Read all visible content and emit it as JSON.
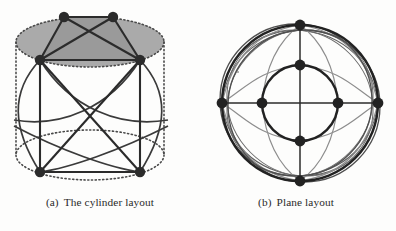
{
  "figure": {
    "background_color": "#fdfdfc",
    "ink_color": "#2b2b2b",
    "shade_color": "#a8a8a8",
    "faint_color": "#8d8d8d",
    "panels": [
      {
        "id": "cylinder",
        "caption_label": "(a)",
        "caption_text": "The cylinder layout",
        "node_radius": 5.2,
        "nodes": [
          {
            "name": "top-back-left",
            "x": 64,
            "y": 17
          },
          {
            "name": "top-back-right",
            "x": 113,
            "y": 17
          },
          {
            "name": "top-front-left",
            "x": 40,
            "y": 60
          },
          {
            "name": "top-front-right",
            "x": 140,
            "y": 60
          },
          {
            "name": "bottom-front-left",
            "x": 40,
            "y": 172
          },
          {
            "name": "bottom-front-right",
            "x": 140,
            "y": 172
          }
        ],
        "top_ellipse": {
          "cx": 90,
          "cy": 42,
          "rx": 74,
          "ry": 25
        },
        "bottom_ellipse": {
          "cx": 90,
          "cy": 155,
          "rx": 74,
          "ry": 25
        },
        "cylinder_height": 113,
        "straight_edges": [
          [
            "top-back-left",
            "top-back-right"
          ],
          [
            "top-back-left",
            "top-front-left"
          ],
          [
            "top-back-left",
            "top-front-right"
          ],
          [
            "top-back-right",
            "top-front-left"
          ],
          [
            "top-back-right",
            "top-front-right"
          ],
          [
            "top-front-left",
            "top-front-right"
          ],
          [
            "top-front-left",
            "bottom-front-left"
          ],
          [
            "top-front-right",
            "bottom-front-right"
          ],
          [
            "top-front-left",
            "bottom-front-right"
          ],
          [
            "top-front-right",
            "bottom-front-left"
          ],
          [
            "bottom-front-left",
            "bottom-front-right"
          ]
        ],
        "wrap_arc_count": 4
      },
      {
        "id": "plane",
        "caption_label": "(b)",
        "caption_text": "Plane layout",
        "center": {
          "x": 104,
          "y": 103
        },
        "outer_radius": 78,
        "inner_radius": 38,
        "node_radius": 5.4,
        "nodes": [
          {
            "name": "outer-top",
            "x": 104,
            "y": 25
          },
          {
            "name": "outer-right",
            "x": 182,
            "y": 103
          },
          {
            "name": "outer-bottom",
            "x": 104,
            "y": 181
          },
          {
            "name": "outer-left",
            "x": 26,
            "y": 103
          },
          {
            "name": "inner-top",
            "x": 104,
            "y": 65
          },
          {
            "name": "inner-right",
            "x": 142,
            "y": 103
          },
          {
            "name": "inner-bottom",
            "x": 104,
            "y": 141
          },
          {
            "name": "inner-left",
            "x": 66,
            "y": 103
          }
        ],
        "axis_lines": [
          {
            "name": "horizontal-axis",
            "x1": 26,
            "y1": 103,
            "x2": 182,
            "y2": 103
          },
          {
            "name": "vertical-axis",
            "x1": 104,
            "y1": 25,
            "x2": 104,
            "y2": 181
          }
        ],
        "halo_ellipse_count": 4,
        "connector_arc_count": 8
      }
    ]
  }
}
